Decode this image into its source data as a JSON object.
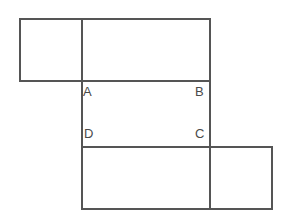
{
  "figure": {
    "canvas": {
      "width": 286,
      "height": 218,
      "background": "#ffffff"
    },
    "stroke": {
      "color": "#555555",
      "width": 1.2
    }
  },
  "rectangles": [
    {
      "name": "top-left-rectangle",
      "x": 20,
      "y": 19,
      "width": 62,
      "height": 62
    },
    {
      "name": "top-right-rectangle",
      "x": 82,
      "y": 19,
      "width": 128,
      "height": 62
    },
    {
      "name": "center-rectangle",
      "x": 82,
      "y": 81,
      "width": 128,
      "height": 66
    },
    {
      "name": "bottom-left-rectangle",
      "x": 82,
      "y": 147,
      "width": 128,
      "height": 62
    },
    {
      "name": "bottom-right-rectangle",
      "x": 210,
      "y": 147,
      "width": 62,
      "height": 62
    }
  ],
  "labels": {
    "a": "A",
    "b": "B",
    "c": "C",
    "d": "D"
  },
  "chart_data": {
    "type": "diagram",
    "shapes": [
      {
        "id": "top-left-rectangle",
        "x": 20,
        "y": 19,
        "w": 62,
        "h": 62
      },
      {
        "id": "top-right-rectangle",
        "x": 82,
        "y": 19,
        "w": 128,
        "h": 62
      },
      {
        "id": "center-rectangle",
        "x": 82,
        "y": 81,
        "w": 128,
        "h": 66
      },
      {
        "id": "bottom-left-rectangle",
        "x": 82,
        "y": 147,
        "w": 128,
        "h": 62
      },
      {
        "id": "bottom-right-rectangle",
        "x": 210,
        "y": 147,
        "w": 62,
        "h": 62
      }
    ],
    "vertices": [
      {
        "label": "A",
        "x": 82,
        "y": 81
      },
      {
        "label": "B",
        "x": 210,
        "y": 81
      },
      {
        "label": "C",
        "x": 210,
        "y": 147
      },
      {
        "label": "D",
        "x": 82,
        "y": 147
      }
    ]
  }
}
